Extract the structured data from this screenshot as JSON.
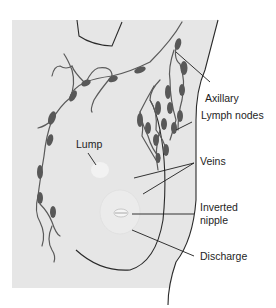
{
  "diagram": {
    "colors": {
      "background": "#ffffff",
      "skin_region": "#e6e6e6",
      "outline": "#2a2a2a",
      "lymph_vessel": "#5a5a5a",
      "lymph_node": "#585858",
      "label_text": "#1e1e1e"
    },
    "labels": {
      "axillary": "Axillary",
      "lymph_nodes": "Lymph nodes",
      "lump": "Lump",
      "veins": "Veins",
      "inverted_line1": "Inverted",
      "inverted_line2": "nipple",
      "discharge": "Discharge"
    }
  }
}
